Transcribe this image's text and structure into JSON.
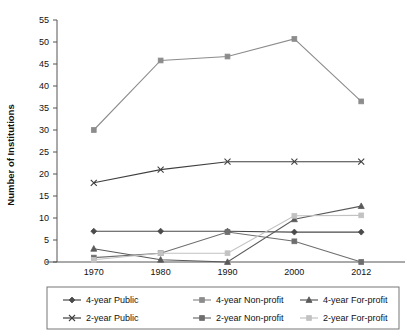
{
  "chart_data": {
    "type": "line",
    "title": "",
    "xlabel": "",
    "ylabel": "Number of Institutions",
    "x": [
      "1970",
      "1980",
      "1990",
      "2000",
      "2012"
    ],
    "categories": [
      "1970",
      "1980",
      "1990",
      "2000",
      "2012"
    ],
    "ylim": [
      0,
      55
    ],
    "ytick_step": 5,
    "yticks": [
      "0",
      "5",
      "10",
      "15",
      "20",
      "25",
      "30",
      "35",
      "40",
      "45",
      "50",
      "55"
    ],
    "grid": false,
    "legend_position": "bottom",
    "series": [
      {
        "name": "4-year Public",
        "values": [
          7,
          7,
          7,
          6.8,
          6.8
        ],
        "marker": "diamond",
        "color": "#4a4a4a"
      },
      {
        "name": "4-year Non-profit",
        "values": [
          30,
          45.8,
          46.7,
          50.7,
          36.5
        ],
        "marker": "square",
        "color": "#8c8c8c"
      },
      {
        "name": "4-year For-profit",
        "values": [
          3,
          0.5,
          0,
          9.7,
          12.7
        ],
        "marker": "triangle",
        "color": "#5a5a5a"
      },
      {
        "name": "2-year Public",
        "values": [
          18,
          21,
          22.8,
          22.8,
          22.8
        ],
        "marker": "x",
        "color": "#3f3f3f"
      },
      {
        "name": "2-year Non-profit",
        "values": [
          1,
          2,
          6.8,
          4.7,
          0
        ],
        "marker": "square",
        "color": "#6e6e6e"
      },
      {
        "name": "2-year For-profit",
        "values": [
          0.5,
          2,
          2,
          10.5,
          10.6
        ],
        "marker": "square",
        "color": "#c2c2c2"
      }
    ]
  },
  "legend": {
    "items": [
      {
        "label": "4-year Public"
      },
      {
        "label": "4-year Non-profit"
      },
      {
        "label": "4-year For-profit"
      },
      {
        "label": "2-year Public"
      },
      {
        "label": "2-year Non-profit"
      },
      {
        "label": "2-year For-profit"
      }
    ]
  }
}
